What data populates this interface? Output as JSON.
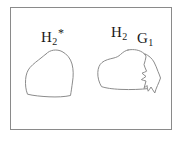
{
  "figure": {
    "type": "schematic-diagram",
    "background_color": "#ffffff",
    "frame": {
      "stroke_color": "#8a8a8a",
      "fill_color": "#ffffff",
      "x": 10,
      "y": 7,
      "width": 162,
      "height": 123
    },
    "regions": [
      {
        "id": "region-h2-star",
        "label_text": "H",
        "label_subscript": "2",
        "label_superscript": "*",
        "label_x": 41,
        "label_y": 27,
        "stroke_color": "#8c8c8c",
        "fill_color": "#ffffff",
        "path": "M 46 54 C 50 49.5 57 49 62 51.5 C 67 54 70.5 58.5 72 64 C 73.5 69.5 73.5 76 72.5 82 C 71.8 87 71.2 91.5 70.5 95.5 C 65 96.8 57 97.2 49 96.8 C 41 96.4 33 95.6 27.5 94.2 C 25.8 90 25.2 84.5 25.6 79.5 C 26 74.5 27.4 70.5 30 67.5 C 33.5 63.5 38 60.5 41 58 C 43 56.3 44.6 55.2 46 54 Z"
      },
      {
        "id": "region-h2",
        "label_text": "H",
        "label_subscript": "2",
        "label_superscript": "",
        "label_x": 111,
        "label_y": 25,
        "stroke_color": "#8c8c8c",
        "fill_color": "#ffffff",
        "path": "M 128 50 C 134 48.8 140 50 144 53.5 C 147.5 56.6 149.5 61 150.5 66 C 151.4 70.5 151.6 75.5 151 80 C 150.5 84 149.8 86.8 149 88.5 C 141 89.4 131 89.8 121 89.4 C 112 89 105.5 88 101.5 86.6 C 99 82.5 97.6 77.5 97.8 72.5 C 98 68 99.4 64.6 102 62.5 C 105 60 109.5 59 113 58.2 C 116.5 57.4 118.5 56.4 120.5 54.5 C 123 52.2 125.4 50.5 128 50 Z"
      },
      {
        "id": "region-g1",
        "label_text": "G",
        "label_subscript": "1",
        "label_superscript": "",
        "label_x": 137,
        "label_y": 31,
        "stroke_color": "#8c8c8c",
        "fill_color": "#ffffff",
        "path": "M 145 54 C 149 55.5 152 58.5 154 62 C 155.8 65.2 156.8 68.5 158 71.5 C 159 74 160 76 160.5 78 C 159.8 80.5 158.6 83 157.5 85.5 C 156.4 88 155.4 90.5 154.8 93 C 153.4 91 152.2 88.8 151 87 C 150 88.6 149.2 90 148.2 91.2 C 147.6 89.4 147.2 87.4 147 85.5 C 146 86.6 145 87.6 144 88.4 C 144.6 86 145.4 83.5 146 81 C 144.4 80.6 142.8 80.2 141.4 79.6 C 143 78.6 144.6 77.6 146 76.4 C 144.6 75.4 143.2 74.4 142 73.2 C 143.6 72.6 145.2 72 146.6 71.2 C 145.6 69 144.6 66.8 144 64.6 C 144.8 62 145.6 59.4 146 56.8 C 145.6 55.8 145.2 54.9 145 54 Z"
      }
    ]
  }
}
